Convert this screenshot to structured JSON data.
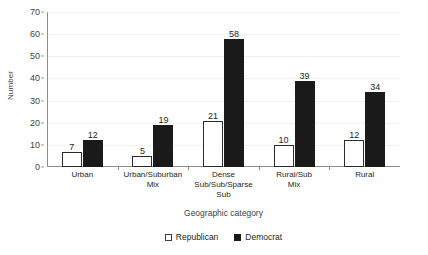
{
  "chart_data": {
    "type": "bar",
    "title": "",
    "xlabel": "Geographic category",
    "ylabel": "Number",
    "ylim": [
      0,
      70
    ],
    "ytick_step": 10,
    "yticks": [
      0,
      10,
      20,
      30,
      40,
      50,
      60,
      70
    ],
    "grid": true,
    "legend_position": "bottom",
    "categories": [
      "Urban",
      "Urban/Suburban Mix",
      "Dense Sub/Sub/Sparse Sub",
      "Rural/Sub Mix",
      "Rural"
    ],
    "category_lines": [
      [
        "Urban"
      ],
      [
        "Urban/Suburban",
        "Mix"
      ],
      [
        "Dense",
        "Sub/Sub/Sparse",
        "Sub"
      ],
      [
        "Rural/Sub",
        "Mix"
      ],
      [
        "Rural"
      ]
    ],
    "series": [
      {
        "name": "Republican",
        "color": "#ffffff",
        "edge_color": "#2b2b2b",
        "values": [
          7,
          5,
          21,
          10,
          12
        ]
      },
      {
        "name": "Democrat",
        "color": "#1a1a1a",
        "edge_color": "#1a1a1a",
        "values": [
          12,
          19,
          58,
          39,
          34
        ]
      }
    ]
  },
  "legend": {
    "items": [
      {
        "label": "Republican",
        "swatch": "open-square-icon"
      },
      {
        "label": "Democrat",
        "swatch": "filled-square-icon"
      }
    ]
  },
  "axis": {
    "y_title": "Number",
    "x_title": "Geographic category"
  }
}
